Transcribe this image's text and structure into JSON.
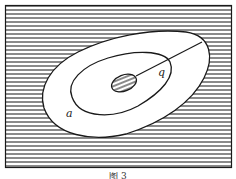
{
  "figure": {
    "caption": "图 3",
    "labels": {
      "outer_contour_label": "a",
      "line_label": "q"
    },
    "colors": {
      "ink": "#1a1a1a",
      "background": "#ffffff",
      "hatch": "#2a2a2a"
    },
    "hatch_spacing_px": 4
  }
}
